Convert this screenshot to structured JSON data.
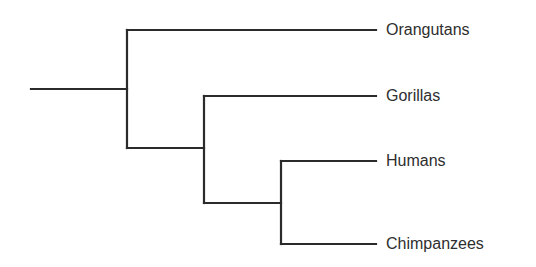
{
  "diagram": {
    "type": "phylogenetic-tree (cladogram)",
    "line_color": "#2b2b2b",
    "text_color": "#2e2e2e",
    "background": "#ffffff",
    "taxa": [
      {
        "label": "Orangutans"
      },
      {
        "label": "Gorillas"
      },
      {
        "label": "Humans"
      },
      {
        "label": "Chimpanzees"
      }
    ],
    "topology": "(Orangutans,(Gorillas,(Humans,Chimpanzees)))"
  }
}
